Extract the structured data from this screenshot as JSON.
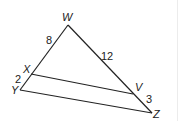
{
  "diagram": {
    "type": "triangle-with-parallel-segment",
    "vertices": {
      "W": {
        "label": "W",
        "x": 68,
        "y": 25,
        "lx": 62,
        "ly": 21
      },
      "X": {
        "label": "X",
        "x": 31,
        "y": 74,
        "lx": 23,
        "ly": 73
      },
      "Y": {
        "label": "Y",
        "x": 20,
        "y": 90,
        "lx": 11,
        "ly": 94
      },
      "V": {
        "label": "V",
        "x": 133,
        "y": 94,
        "lx": 135,
        "ly": 91
      },
      "Z": {
        "label": "Z",
        "x": 152,
        "y": 113,
        "lx": 153,
        "ly": 118
      }
    },
    "segment_labels": {
      "WX": {
        "text": "8",
        "x": 46,
        "y": 44
      },
      "WV": {
        "text": "12",
        "x": 101,
        "y": 60
      },
      "XY": {
        "text": "2",
        "x": 15,
        "y": 83
      },
      "VZ": {
        "text": "3",
        "x": 146,
        "y": 103
      }
    },
    "edges": [
      {
        "from": "W",
        "to": "Y"
      },
      {
        "from": "W",
        "to": "Z"
      },
      {
        "from": "Y",
        "to": "Z"
      },
      {
        "from": "X",
        "to": "V"
      }
    ]
  }
}
